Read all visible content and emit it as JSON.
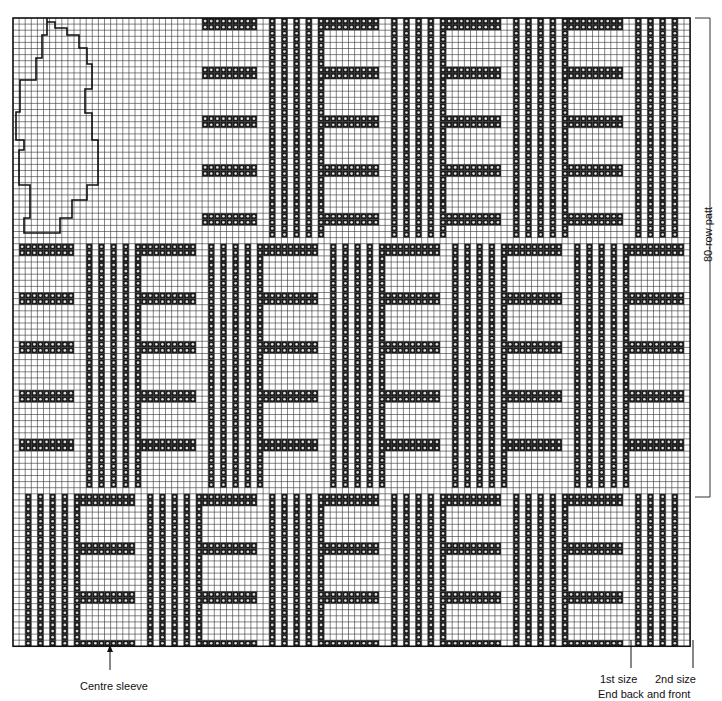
{
  "diagram": {
    "type": "knitting-chart",
    "grid": {
      "x0": 13,
      "y0": 18,
      "cols": 111,
      "rows": 103,
      "cell": 6.1,
      "line_color": "#333333",
      "bg": "#ffffff"
    },
    "stitch_color": "#1a1a1a",
    "sections": {
      "top": {
        "row_start": 0,
        "row_end": 35,
        "block_col_start": 31,
        "first_block": "h"
      },
      "middle": {
        "row_start": 37,
        "row_end": 76,
        "block_col_start": 1,
        "first_block": "h"
      },
      "bottom": {
        "row_start": 78,
        "row_end": 102,
        "block_col_start": 1,
        "first_block": "v"
      }
    },
    "block_width_cols": 10,
    "pocket_outline": true
  },
  "labels": {
    "pattern_repeat": "80-row patt",
    "centre_sleeve": "Centre sleeve",
    "first_size": "1st size",
    "second_size": "2nd size",
    "end_back_front": "End back and front"
  }
}
